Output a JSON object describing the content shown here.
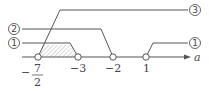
{
  "diagram": {
    "type": "number-line",
    "axis_label": "a",
    "points": [
      {
        "id": "p1",
        "label_num": "7",
        "label_den": "2",
        "label_sign": "−",
        "value": -3.5,
        "open": true
      },
      {
        "id": "p2",
        "label": "−3",
        "value": -3,
        "open": true
      },
      {
        "id": "p3",
        "label": "−2",
        "value": -2,
        "open": true
      },
      {
        "id": "p4",
        "label": "1",
        "value": 1,
        "open": true
      }
    ],
    "ranges": [
      {
        "id": "r1a",
        "marker": "①",
        "from": "-7/2",
        "to": "-3",
        "shaded": true
      },
      {
        "id": "r2",
        "marker": "②",
        "from": "-7/2",
        "to": "-2"
      },
      {
        "id": "r3",
        "marker": "③",
        "from": "-7/2",
        "to": "+∞"
      },
      {
        "id": "r1b",
        "marker": "①",
        "from": "1",
        "to": "+∞"
      }
    ],
    "colors": {
      "line": "#555555",
      "shade": "#c8c8c8"
    }
  }
}
